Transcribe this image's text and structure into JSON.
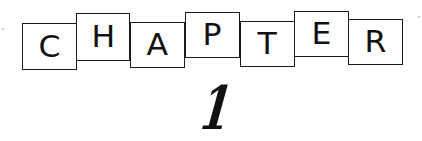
{
  "heading": {
    "letters": [
      "C",
      "H",
      "A",
      "P",
      "T",
      "E",
      "R"
    ],
    "number": "1"
  },
  "colors": {
    "ink": "#111111",
    "background": "#ffffff"
  }
}
